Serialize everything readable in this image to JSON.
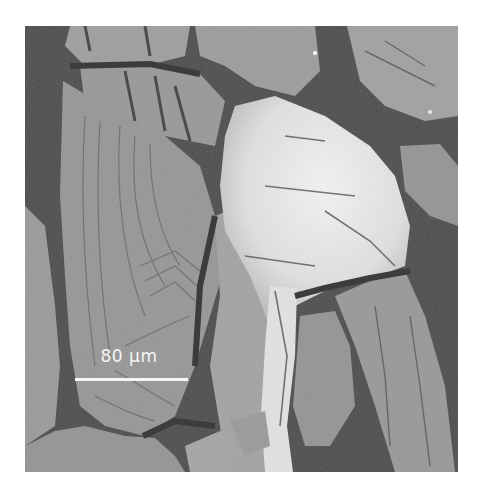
{
  "figure": {
    "type": "SEM micrograph",
    "scale_bar": {
      "label": "80 µm",
      "color": "#f6f6f6"
    },
    "palette": {
      "background_void": "#4c4c4c",
      "plate_gray": "#9c9c9c",
      "plate_light": "#b4b4b4",
      "bright_region": "#ececec",
      "crack_dark": "#3a3a3a"
    }
  }
}
